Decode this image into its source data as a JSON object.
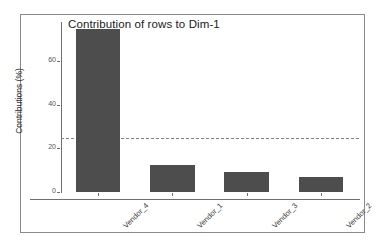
{
  "chart_data": {
    "type": "bar",
    "title": "Contribution of rows to Dim-1",
    "xlabel": "",
    "ylabel": "Contributions (%)",
    "categories": [
      "Vendor_4",
      "Vendor_1",
      "Vendor_3",
      "Vendor_2"
    ],
    "values": [
      75,
      12.5,
      9,
      7
    ],
    "ylim": [
      0,
      78
    ],
    "yticks": [
      "0",
      "20",
      "40",
      "60"
    ],
    "ytick_values": [
      0,
      20,
      40,
      60
    ],
    "grid": false,
    "legend": false,
    "reference_line": {
      "value": 25,
      "style": "dashed",
      "color": "#7b7f9e"
    },
    "bar_color": "#4d4d4d",
    "axis_color": "#6e6e6e",
    "background": "#ffffff"
  },
  "figure": {
    "frame_color": "#8a8a8a"
  }
}
